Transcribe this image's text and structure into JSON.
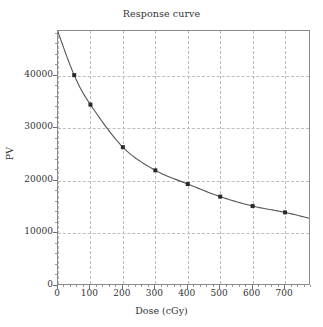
{
  "chart_data": {
    "type": "line",
    "title": "Response curve",
    "xlabel": "Dose (cGy)",
    "ylabel": "PV",
    "xlim": [
      0,
      780
    ],
    "ylim": [
      0,
      48500
    ],
    "grid": true,
    "legend": false,
    "xticks": [
      0,
      100,
      200,
      300,
      400,
      500,
      600,
      700
    ],
    "xtick_labels": [
      "0",
      "100",
      "200",
      "300",
      "400",
      "500",
      "600",
      "700"
    ],
    "yticks": [
      0,
      10000,
      20000,
      30000,
      40000
    ],
    "ytick_labels": [
      "0",
      "10000",
      "20000",
      "30000",
      "40000"
    ],
    "series": [
      {
        "name": "Response",
        "marker": "square",
        "marker_color": "#2a2a2a",
        "line_color": "#555555",
        "x": [
          0,
          50,
          100,
          200,
          300,
          400,
          500,
          600,
          700,
          780
        ],
        "values": [
          48300,
          40100,
          34500,
          26400,
          22000,
          19400,
          17000,
          15200,
          14000,
          12800
        ]
      }
    ],
    "marker_points": {
      "x": [
        50,
        100,
        200,
        300,
        400,
        500,
        600,
        700
      ],
      "values": [
        40100,
        34500,
        26400,
        22000,
        19400,
        17000,
        15200,
        14000
      ]
    }
  }
}
